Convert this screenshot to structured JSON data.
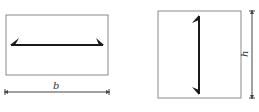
{
  "figures": [
    {
      "id": "left-section",
      "arrow_orientation": "horizontal",
      "dimension_label": "b",
      "dimension_position": "bottom"
    },
    {
      "id": "right-section",
      "arrow_orientation": "vertical",
      "dimension_label": "h",
      "dimension_position": "right"
    }
  ],
  "colors": {
    "outline": "#8a8a8a",
    "arrow": "#1a1a1a",
    "dimension": "#444444"
  }
}
